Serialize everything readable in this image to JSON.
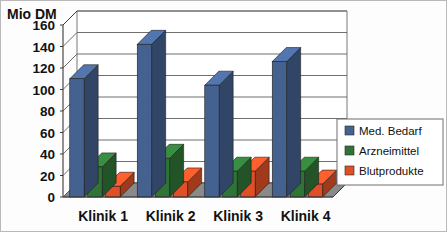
{
  "chart_data": {
    "type": "bar",
    "title": "",
    "subtitle": "",
    "xlabel": "",
    "ylabel": "Mio DM",
    "ylim": [
      0,
      160
    ],
    "ytick_step": 20,
    "yticks": [
      0,
      20,
      40,
      60,
      80,
      100,
      120,
      140,
      160
    ],
    "ytick_labels": [
      "0",
      "20",
      "40",
      "60",
      "80",
      "100",
      "120",
      "140",
      "160"
    ],
    "grid": true,
    "grid_axis": "y",
    "legend_position": "right",
    "projection": "3d",
    "categories": [
      "Klinik 1",
      "Klinik 2",
      "Klinik 3",
      "Klinik 4"
    ],
    "series": [
      {
        "name": "Med. Bedarf",
        "color": "#44618f",
        "values": [
          110,
          142,
          104,
          126
        ]
      },
      {
        "name": "Arzneimittel",
        "color": "#2f7436",
        "values": [
          28,
          36,
          24,
          24
        ]
      },
      {
        "name": "Blutprodukte",
        "color": "#e04f26",
        "values": [
          10,
          14,
          24,
          12
        ]
      }
    ]
  },
  "axis": {
    "y_title": "Mio DM"
  },
  "legend": {
    "entries": [
      {
        "label": "Med. Bedarf",
        "color": "#44618f"
      },
      {
        "label": "Arzneimittel",
        "color": "#2f7436"
      },
      {
        "label": "Blutprodukte",
        "color": "#e04f26"
      }
    ]
  },
  "colors": {
    "plot_background": "#ffffff",
    "floor": "#8a8a8a",
    "gridline": "#5f5f5f",
    "axis_line": "#3a3a3a",
    "text": "#121212",
    "legend_border": "#6e6e6e"
  }
}
